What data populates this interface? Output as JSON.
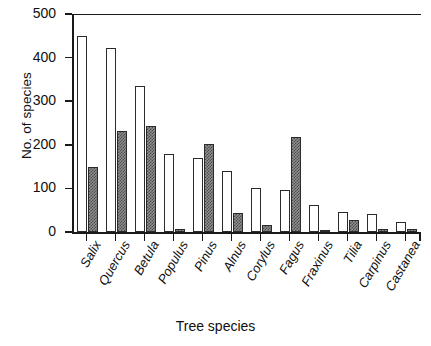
{
  "chart_data": {
    "type": "bar",
    "title": "",
    "xlabel": "Tree species",
    "ylabel": "No. of species",
    "ylim": [
      0,
      500
    ],
    "yticks": [
      0,
      100,
      200,
      300,
      400,
      500
    ],
    "grid": false,
    "legend": "none",
    "categories": [
      "Salix",
      "Quercus",
      "Betula",
      "Populus",
      "Pinus",
      "Alnus",
      "Corylus",
      "Fagus",
      "Fraxinus",
      "Tilia",
      "Carpinus",
      "Castanea"
    ],
    "series": [
      {
        "name": "white-bar",
        "style": "open",
        "values": [
          450,
          422,
          334,
          180,
          170,
          140,
          101,
          96,
          62,
          46,
          41,
          23
        ]
      },
      {
        "name": "hatched-bar",
        "style": "checkered-gray",
        "values": [
          149,
          231,
          243,
          8,
          201,
          44,
          16,
          218,
          3,
          28,
          6,
          7
        ]
      }
    ]
  },
  "axes": {
    "y_tick_labels": [
      "0",
      "100",
      "200",
      "300",
      "400",
      "500"
    ],
    "y_axis_title": "No. of species",
    "x_axis_title": "Tree species"
  },
  "colors": {
    "axis": "#1a1a1a",
    "bar_open_fill": "#ffffff",
    "bar_open_stroke": "#2b2b2b",
    "bar_hatch_light": "#8f8f8f",
    "bar_hatch_dark": "#4a4a4a",
    "text": "#101010",
    "background": "#ffffff"
  }
}
